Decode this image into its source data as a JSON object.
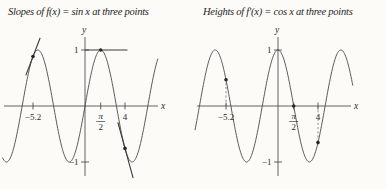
{
  "page": {
    "background": "#fcfbf8",
    "ink": "#3c3c3c"
  },
  "chart_data": [
    {
      "type": "line",
      "title": "Slopes of f(x) = sin x at three points",
      "function": "sin(x)",
      "xlabel": "x",
      "ylabel": "y",
      "x_domain": [
        -8.25,
        7.3
      ],
      "ylim": [
        -1,
        1
      ],
      "grid": false,
      "legend": false,
      "x_ticks": [
        {
          "value": -5.2,
          "label": "−5.2"
        },
        {
          "value": 1.5708,
          "label": "π/2"
        },
        {
          "value": 4,
          "label": "4"
        }
      ],
      "y_ticks": [
        {
          "value": 1,
          "label": "1"
        },
        {
          "value": -1,
          "label": "−1"
        }
      ],
      "marked_points": [
        {
          "x": -5.2,
          "y": 0.883
        },
        {
          "x": 1.5708,
          "y": 1.0
        },
        {
          "x": 4,
          "y": -0.757
        }
      ],
      "point_slopes": [
        0.469,
        0.0,
        -0.654
      ],
      "tangent_segments": [
        {
          "x1": -5.9,
          "y1": 0.555,
          "x2": -4.5,
          "y2": 1.211
        },
        {
          "x1": 0.05,
          "y1": 1.0,
          "x2": 4.2,
          "y2": 1.0
        },
        {
          "x1": 3.3,
          "y1": -0.299,
          "x2": 4.8,
          "y2": -1.28
        }
      ]
    },
    {
      "type": "line",
      "title": "Heights of f′(x) = cos x at three points",
      "function": "cos(x)",
      "xlabel": "x",
      "ylabel": "y",
      "x_domain": [
        -8.3,
        7.5
      ],
      "ylim": [
        -1,
        1
      ],
      "grid": false,
      "legend": false,
      "x_ticks": [
        {
          "value": -5.2,
          "label": "−5.2"
        },
        {
          "value": 1.5708,
          "label": "π/2"
        },
        {
          "value": 4,
          "label": "4"
        }
      ],
      "y_ticks": [
        {
          "value": 1,
          "label": "1"
        },
        {
          "value": -1,
          "label": "−1"
        }
      ],
      "marked_points": [
        {
          "x": -5.2,
          "y": 0.469
        },
        {
          "x": 1.5708,
          "y": 0.0
        },
        {
          "x": 4,
          "y": -0.654
        }
      ],
      "drop_lines": [
        {
          "x": -5.2,
          "y": 0.469
        },
        {
          "x": 4,
          "y": -0.654
        }
      ]
    }
  ]
}
